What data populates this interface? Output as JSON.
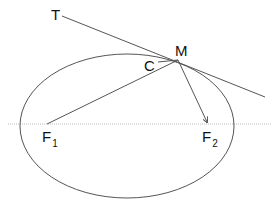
{
  "diagram": {
    "labels": {
      "T": "T",
      "M": "M",
      "C": "C",
      "F1_main": "F",
      "F1_sub": "1",
      "F2_main": "F",
      "F2_sub": "2"
    },
    "colors": {
      "line": "#555555",
      "axis": "#bbbbbb",
      "text": "#111111"
    }
  }
}
